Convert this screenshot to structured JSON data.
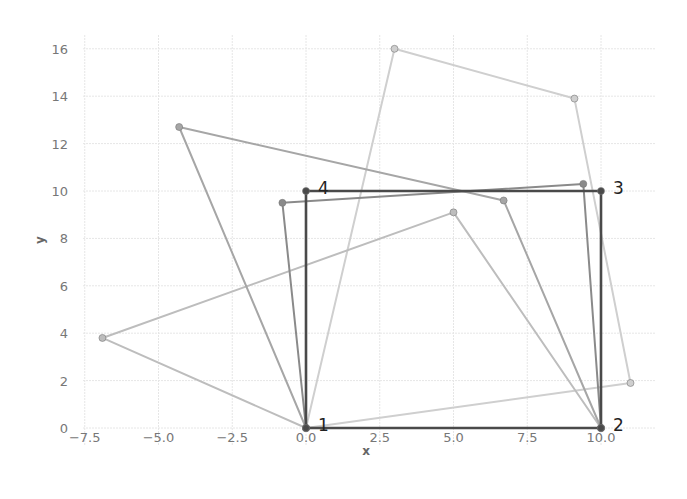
{
  "chart_data": {
    "type": "line",
    "title": "",
    "xlabel": "x",
    "ylabel": "y",
    "xlim": [
      -7.9,
      11.6
    ],
    "ylim": [
      -0.7,
      16.6
    ],
    "grid": true,
    "legend": null,
    "x_ticks": [
      -7.5,
      -5.0,
      -2.5,
      0.0,
      2.5,
      5.0,
      7.5,
      10.0
    ],
    "x_tick_labels": [
      "−7.5",
      "−5.0",
      "−2.5",
      "0.0",
      "2.5",
      "5.0",
      "7.5",
      "10.0"
    ],
    "y_ticks": [
      0,
      2,
      4,
      6,
      8,
      10,
      12,
      14,
      16
    ],
    "y_tick_labels": [
      "0",
      "2",
      "4",
      "6",
      "8",
      "10",
      "12",
      "14",
      "16"
    ],
    "series": [
      {
        "name": "polygon-5",
        "color": "#cfcfcf",
        "closed": true,
        "points": [
          [
            0,
            0
          ],
          [
            11.0,
            1.9
          ],
          [
            9.1,
            13.9
          ],
          [
            3.0,
            16.0
          ]
        ]
      },
      {
        "name": "polygon-4",
        "color": "#bdbdbd",
        "closed": true,
        "points": [
          [
            0,
            0
          ],
          [
            10,
            0
          ],
          [
            5.0,
            9.1
          ],
          [
            -6.9,
            3.8
          ]
        ]
      },
      {
        "name": "polygon-3",
        "color": "#a6a6a6",
        "closed": true,
        "points": [
          [
            0,
            0
          ],
          [
            10,
            0
          ],
          [
            6.7,
            9.6
          ],
          [
            -4.3,
            12.7
          ]
        ]
      },
      {
        "name": "polygon-2",
        "color": "#8a8a8a",
        "closed": true,
        "points": [
          [
            0,
            0
          ],
          [
            10,
            0
          ],
          [
            9.4,
            10.3
          ],
          [
            -0.8,
            9.5
          ]
        ]
      },
      {
        "name": "polygon-1",
        "color": "#4a4a4a",
        "closed": true,
        "points": [
          [
            0,
            0
          ],
          [
            10,
            0
          ],
          [
            10,
            10
          ],
          [
            0,
            10
          ]
        ]
      }
    ],
    "annotations": [
      {
        "text": "1",
        "x": 0,
        "y": 0
      },
      {
        "text": "2",
        "x": 10,
        "y": 0
      },
      {
        "text": "3",
        "x": 10,
        "y": 10
      },
      {
        "text": "4",
        "x": 0,
        "y": 10
      }
    ]
  }
}
